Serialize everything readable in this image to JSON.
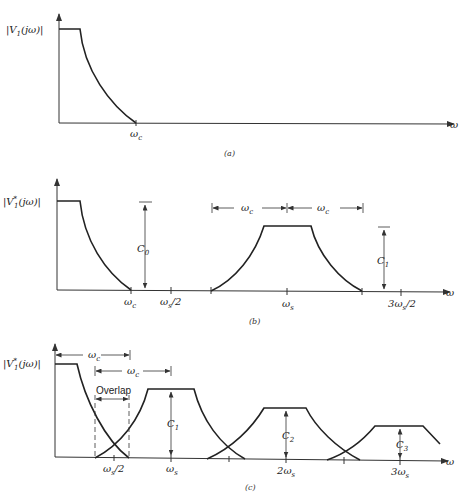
{
  "figure": {
    "panels": [
      {
        "id": "a",
        "caption": "(a)",
        "ylabel": "|V₁(jω)|",
        "xaxis_symbol": "ω",
        "ticks": [
          "ωc"
        ]
      },
      {
        "id": "b",
        "caption": "(b)",
        "ylabel": "|V₁*(jω)|",
        "xaxis_symbol": "ω",
        "ticks": [
          "ωc",
          "ωs/2",
          "ωs",
          "3ωs/2"
        ],
        "annotations": [
          "C0",
          "C1",
          "ωc",
          "ωc"
        ]
      },
      {
        "id": "c",
        "caption": "(c)",
        "ylabel": "|V₁*(jω)|",
        "xaxis_symbol": "ω",
        "ticks": [
          "ωs/2",
          "ωs",
          "2ωs",
          "3ωs"
        ],
        "annotations": [
          "ωc",
          "ωc",
          "Overlap",
          "C1",
          "C2",
          "C3"
        ]
      }
    ]
  },
  "labels": {
    "a_ylabel_main": "|V",
    "a_ylabel_sub": "1",
    "a_ylabel_tail": "(jω)|",
    "b_ylabel_main": "|V",
    "b_ylabel_sub": "1",
    "b_ylabel_sup": "*",
    "b_ylabel_tail": "(jω)|",
    "c_ylabel_main": "|V",
    "c_ylabel_sub": "1",
    "c_ylabel_sup": "*",
    "c_ylabel_tail": "(jω)|",
    "omega": "ω",
    "omega_c": "ω",
    "c_sub": "c",
    "s_sub": "s",
    "half": "/2",
    "three": "3",
    "two": "2",
    "C": "C",
    "sub0": "0",
    "sub1": "1",
    "sub2": "2",
    "sub3": "3",
    "overlap": "Overlap",
    "cap_a": "(a)",
    "cap_b": "(b)",
    "cap_c": "(c)"
  }
}
